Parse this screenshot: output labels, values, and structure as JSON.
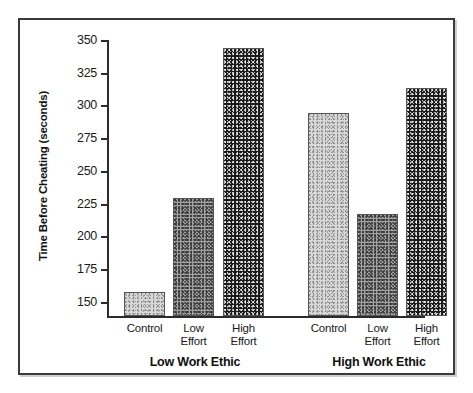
{
  "chart_data": {
    "type": "bar",
    "title": "",
    "xlabel": "",
    "ylabel": "Time Before Cheating (seconds)",
    "ylim": [
      140,
      355
    ],
    "grid": false,
    "legend": "none",
    "yticks": [
      150,
      175,
      200,
      225,
      250,
      275,
      300,
      325,
      350
    ],
    "groups": [
      {
        "name": "Low Work Ethic",
        "categories": [
          "Control",
          "Low Effort",
          "High Effort"
        ],
        "values": [
          158,
          230,
          345
        ],
        "shades": [
          "light",
          "medium",
          "dark"
        ]
      },
      {
        "name": "High Work Ethic",
        "categories": [
          "Control",
          "Low Effort",
          "High Effort"
        ],
        "values": [
          295,
          218,
          314
        ],
        "shades": [
          "light",
          "medium",
          "dark"
        ]
      }
    ],
    "categories": [
      "Control",
      "Low Effort",
      "High Effort"
    ],
    "series": [
      {
        "name": "Low Work Ethic",
        "values": [
          158,
          230,
          345
        ]
      },
      {
        "name": "High Work Ethic",
        "values": [
          295,
          218,
          314
        ]
      }
    ]
  },
  "axis": {
    "y_title": "Time Before Cheating (seconds)",
    "ticks": [
      {
        "value": 350,
        "label": "350"
      },
      {
        "value": 325,
        "label": "325"
      },
      {
        "value": 300,
        "label": "300"
      },
      {
        "value": 275,
        "label": "275"
      },
      {
        "value": 250,
        "label": "250"
      },
      {
        "value": 225,
        "label": "225"
      },
      {
        "value": 200,
        "label": "200"
      },
      {
        "value": 175,
        "label": "175"
      },
      {
        "value": 150,
        "label": "150"
      }
    ]
  },
  "bars": [
    {
      "label_line1": "Control",
      "label_line2": "",
      "value": 158,
      "shade": "light"
    },
    {
      "label_line1": "Low",
      "label_line2": "Effort",
      "value": 230,
      "shade": "medium"
    },
    {
      "label_line1": "High",
      "label_line2": "Effort",
      "value": 345,
      "shade": "dark"
    },
    {
      "label_line1": "Control",
      "label_line2": "",
      "value": 295,
      "shade": "light"
    },
    {
      "label_line1": "Low",
      "label_line2": "Effort",
      "value": 218,
      "shade": "medium"
    },
    {
      "label_line1": "High",
      "label_line2": "Effort",
      "value": 314,
      "shade": "dark"
    }
  ],
  "groups": [
    {
      "label": "Low Work Ethic"
    },
    {
      "label": "High Work Ethic"
    }
  ],
  "colors": {
    "frame": "#3a3a3a",
    "axis": "#2b2b2b",
    "text": "#101010",
    "bar_light": "#d8d8d8",
    "bar_medium": "#a2a2a2",
    "bar_dark": "#1b1b1b"
  },
  "footer": {
    "mark": ""
  }
}
